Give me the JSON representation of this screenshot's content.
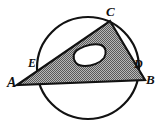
{
  "figure": {
    "kind": "geometry-diagram",
    "background_color": "#ffffff",
    "stroke_color": "#121212",
    "fill_color": "#8c8c8c",
    "hole_fill_color": "#ffffff",
    "canvas": {
      "width": 163,
      "height": 129
    },
    "circle": {
      "name": "circle",
      "cx": 88,
      "cy": 68,
      "r": 51,
      "stroke_width": 2.2
    },
    "triangle": {
      "name": "triangle-ABC",
      "points": "17,85 110,21 145,80",
      "stroke_width": 2.2
    },
    "hole": {
      "name": "inner-hole",
      "path": "M 76,63 C 72,58 73,52 79,49 C 86,45 95,43 101,45 C 106,47 107,53 104,58 C 100,63 92,66 85,66 C 81,66 78,65 76,63 Z",
      "stroke_width": 2.0
    },
    "labels": [
      {
        "id": "A",
        "text": "A",
        "x": 7,
        "y": 76
      },
      {
        "id": "B",
        "text": "B",
        "x": 146,
        "y": 73
      },
      {
        "id": "C",
        "text": "C",
        "x": 106,
        "y": 5
      },
      {
        "id": "D",
        "text": "D",
        "x": 134,
        "y": 58
      },
      {
        "id": "E",
        "text": "E",
        "x": 28,
        "y": 57
      }
    ]
  }
}
